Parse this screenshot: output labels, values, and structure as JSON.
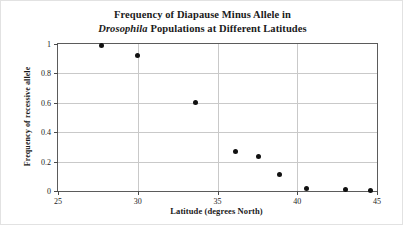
{
  "chart_data": {
    "type": "scatter",
    "title": "Frequency of Diapause Minus Allele in Drosophila Populations at Different Latitudes",
    "title_line1": "Frequency of Diapause Minus Allele in",
    "title_line2_italic": "Drosophila",
    "title_line2_rest": " Populations at Different Latitudes",
    "xlabel": "Latitude (degrees North)",
    "ylabel": "Frequency of recessive allele",
    "xlim": [
      25,
      45
    ],
    "ylim": [
      0,
      1
    ],
    "xticks": [
      "25",
      "30",
      "35",
      "40",
      "45"
    ],
    "xtick_values": [
      25,
      30,
      35,
      40,
      45
    ],
    "yticks": [
      "0",
      "0.2",
      "0.4",
      "0.6",
      "0.8",
      "1"
    ],
    "ytick_values": [
      0,
      0.2,
      0.4,
      0.6,
      0.8,
      1
    ],
    "grid": true,
    "legend": null,
    "marker": "filled-circle",
    "marker_color": "#111111",
    "x": [
      27.7,
      30.0,
      33.6,
      36.1,
      37.6,
      38.9,
      40.6,
      43.0,
      44.6
    ],
    "y": [
      0.99,
      0.92,
      0.6,
      0.27,
      0.235,
      0.115,
      0.015,
      0.01,
      0.005
    ],
    "points": [
      {
        "x": 27.7,
        "y": 0.99
      },
      {
        "x": 30.0,
        "y": 0.92
      },
      {
        "x": 33.6,
        "y": 0.6
      },
      {
        "x": 36.1,
        "y": 0.27
      },
      {
        "x": 37.6,
        "y": 0.235
      },
      {
        "x": 38.9,
        "y": 0.115
      },
      {
        "x": 40.6,
        "y": 0.015
      },
      {
        "x": 43.0,
        "y": 0.01
      },
      {
        "x": 44.6,
        "y": 0.005
      }
    ]
  }
}
